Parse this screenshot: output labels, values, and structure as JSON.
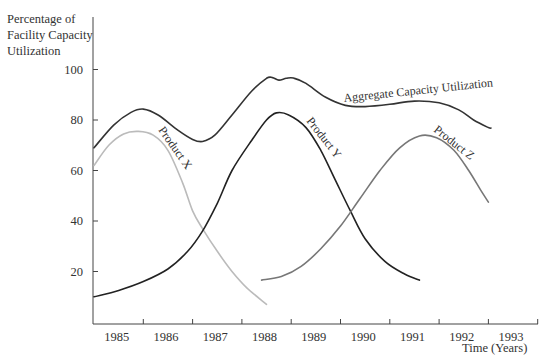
{
  "chart_data": {
    "type": "line",
    "title": "",
    "ylabel": "Percentage of Facility Capacity Utilization",
    "ylabel_lines": [
      "Percentage of",
      "Facility Capacity",
      "Utilization"
    ],
    "xlabel": "Time (Years)",
    "ylim": [
      0,
      100
    ],
    "xlim": [
      1985,
      1994
    ],
    "grid": false,
    "legend": "inline labels on curves",
    "y_ticks": [
      20,
      40,
      60,
      80,
      100
    ],
    "x_tick_labels": [
      "1985",
      "1986",
      "1987",
      "1988",
      "1989",
      "1990",
      "1991",
      "1992",
      "1993"
    ],
    "series": [
      {
        "name": "Aggregate Capacity Utilization",
        "color": "#333333",
        "points": [
          [
            1985.0,
            69
          ],
          [
            1985.4,
            78
          ],
          [
            1985.75,
            83
          ],
          [
            1986.0,
            84.3
          ],
          [
            1986.3,
            82
          ],
          [
            1986.7,
            76
          ],
          [
            1987.0,
            72.3
          ],
          [
            1987.2,
            71.5
          ],
          [
            1987.45,
            74
          ],
          [
            1987.8,
            82
          ],
          [
            1988.2,
            91.5
          ],
          [
            1988.5,
            96.5
          ],
          [
            1988.62,
            96.8
          ],
          [
            1988.75,
            95.8
          ],
          [
            1988.9,
            96.5
          ],
          [
            1989.05,
            96.6
          ],
          [
            1989.3,
            94.5
          ],
          [
            1989.7,
            89
          ],
          [
            1990.1,
            85.8
          ],
          [
            1990.5,
            85.3
          ],
          [
            1991.0,
            86.2
          ],
          [
            1991.5,
            87.5
          ],
          [
            1992.0,
            86.8
          ],
          [
            1992.4,
            84
          ],
          [
            1992.7,
            80
          ],
          [
            1993.0,
            77
          ],
          [
            1993.05,
            76.8
          ]
        ],
        "label_position": [
          344,
          102
        ],
        "label_angle": -6
      },
      {
        "name": "Product X",
        "color": "#bbbbbb",
        "points": [
          [
            1985.0,
            62
          ],
          [
            1985.3,
            70
          ],
          [
            1985.6,
            74.5
          ],
          [
            1985.9,
            75.5
          ],
          [
            1986.2,
            74
          ],
          [
            1986.5,
            68
          ],
          [
            1986.8,
            55
          ],
          [
            1987.0,
            44
          ],
          [
            1987.2,
            37
          ],
          [
            1987.5,
            28
          ],
          [
            1987.8,
            20
          ],
          [
            1988.1,
            13.5
          ],
          [
            1988.5,
            7
          ]
        ],
        "label_position": [
          158,
          130
        ],
        "label_angle": 55
      },
      {
        "name": "Product Y",
        "color": "#222222",
        "points": [
          [
            1985.0,
            10
          ],
          [
            1985.5,
            12.5
          ],
          [
            1986.0,
            16
          ],
          [
            1986.5,
            21
          ],
          [
            1986.9,
            28
          ],
          [
            1987.2,
            36
          ],
          [
            1987.5,
            47
          ],
          [
            1987.8,
            60
          ],
          [
            1988.2,
            72
          ],
          [
            1988.5,
            80
          ],
          [
            1988.7,
            82.8
          ],
          [
            1988.95,
            82
          ],
          [
            1989.3,
            77
          ],
          [
            1989.6,
            68
          ],
          [
            1989.9,
            56
          ],
          [
            1990.2,
            44
          ],
          [
            1990.5,
            33
          ],
          [
            1990.9,
            24
          ],
          [
            1991.3,
            19
          ],
          [
            1991.6,
            16.6
          ]
        ],
        "label_position": [
          306,
          121
        ],
        "label_angle": 52
      },
      {
        "name": "Product Z",
        "color": "#777777",
        "points": [
          [
            1988.4,
            16.6
          ],
          [
            1988.8,
            18
          ],
          [
            1989.2,
            22
          ],
          [
            1989.6,
            29
          ],
          [
            1990.0,
            38
          ],
          [
            1990.4,
            49
          ],
          [
            1990.8,
            60
          ],
          [
            1991.2,
            69
          ],
          [
            1991.6,
            73.7
          ],
          [
            1991.95,
            73
          ],
          [
            1992.3,
            68
          ],
          [
            1992.6,
            60
          ],
          [
            1992.85,
            52
          ],
          [
            1993.0,
            47.5
          ]
        ],
        "label_position": [
          433,
          131
        ],
        "label_angle": 38
      }
    ]
  },
  "axis": {
    "y_tick_labels": [
      "100",
      "80",
      "60",
      "40",
      "20"
    ],
    "x_tick_labels": [
      "1985",
      "1986",
      "1987",
      "1988",
      "1989",
      "1990",
      "1991",
      "1992",
      "1993"
    ],
    "x_title": "Time (Years)",
    "y_title_lines": [
      "Percentage of",
      "Facility Capacity",
      "Utilization"
    ]
  }
}
